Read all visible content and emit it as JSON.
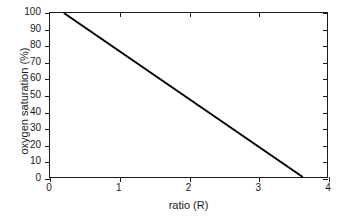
{
  "chart_data": {
    "type": "line",
    "title": "",
    "subtitle": "",
    "xlabel": "ratio (R)",
    "ylabel": "oxygen saturation (%)",
    "xlim": [
      0,
      4
    ],
    "ylim": [
      0,
      100
    ],
    "xticks": [
      0,
      1,
      2,
      3,
      4
    ],
    "yticks": [
      0,
      10,
      20,
      30,
      40,
      50,
      60,
      70,
      80,
      90,
      100
    ],
    "xticklabels": [
      "0",
      "1",
      "2",
      "3",
      "4"
    ],
    "yticklabels": [
      "0",
      "10",
      "20",
      "30",
      "40",
      "50",
      "60",
      "70",
      "80",
      "90",
      "100"
    ],
    "grid": false,
    "legend": null,
    "legend_position": "none",
    "frame": "full-box",
    "tick_direction": {
      "left": "out",
      "bottom": "out",
      "top": "in",
      "right": "in"
    },
    "series": [
      {
        "name": "oxygen saturation",
        "color": "#000000",
        "linewidth": 2,
        "x": [
          0.2,
          3.65
        ],
        "y": [
          100,
          0
        ],
        "points": [
          [
            0.2,
            100.0
          ],
          [
            0.5,
            91.3
          ],
          [
            1.0,
            76.8
          ],
          [
            1.5,
            62.3
          ],
          [
            2.0,
            47.8
          ],
          [
            2.5,
            33.3
          ],
          [
            3.0,
            18.8
          ],
          [
            3.65,
            0.0
          ]
        ]
      }
    ]
  },
  "axes": {
    "x_title": "ratio (R)",
    "y_title": "oxygen saturation (%)"
  },
  "ticks": {
    "x": [
      {
        "label": "0",
        "value": 0
      },
      {
        "label": "1",
        "value": 1
      },
      {
        "label": "2",
        "value": 2
      },
      {
        "label": "3",
        "value": 3
      },
      {
        "label": "4",
        "value": 4
      }
    ],
    "y": [
      {
        "label": "0",
        "value": 0
      },
      {
        "label": "10",
        "value": 10
      },
      {
        "label": "20",
        "value": 20
      },
      {
        "label": "30",
        "value": 30
      },
      {
        "label": "40",
        "value": 40
      },
      {
        "label": "50",
        "value": 50
      },
      {
        "label": "60",
        "value": 60
      },
      {
        "label": "70",
        "value": 70
      },
      {
        "label": "80",
        "value": 80
      },
      {
        "label": "90",
        "value": 90
      },
      {
        "label": "100",
        "value": 100
      }
    ]
  },
  "colors": {
    "line": "#000000",
    "axis": "#1a1a1a",
    "background": "#ffffff"
  }
}
